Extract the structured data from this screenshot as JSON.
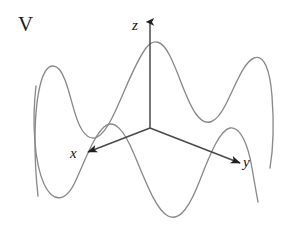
{
  "figure": {
    "panel_label": "V",
    "background_color": "#ffffff",
    "curve_color": "#8a8a8a",
    "axis_color": "#4a4a4a",
    "label_color": "#141414",
    "axes": [
      {
        "id": "z",
        "label": "z",
        "direction": "up",
        "origin": [
          150,
          128
        ],
        "tip": [
          150,
          22
        ]
      },
      {
        "id": "x",
        "label": "x",
        "direction": "down-left",
        "origin": [
          150,
          128
        ],
        "tip": [
          88,
          152
        ]
      },
      {
        "id": "y",
        "label": "y",
        "direction": "down-right",
        "origin": [
          150,
          128
        ],
        "tip": [
          240,
          163
        ]
      }
    ],
    "curves": [
      {
        "name": "back-contour",
        "description": "rear wavy profile of the surface: sharp left peak, deep dip, tall central crest near z-axis, right dip, tall right crest",
        "path": "M 38,196 C 34,160 33,110 41,82 C 47,61 58,61 65,80 C 72,98 74,118 82,130 C 92,145 102,138 112,118 C 124,94 134,64 146,48 C 154,38 162,40 170,56 C 180,76 186,100 196,114 C 206,128 216,124 226,104 C 236,84 244,62 254,58 C 264,54 270,70 272,96 C 274,122 273,150 270,168"
      },
      {
        "name": "front-contour",
        "description": "front wavy profile of the surface: left dip, mid-left crest, deep central trough, right crest",
        "path": "M 36,86 C 32,120 34,162 44,184 C 53,203 66,203 76,180 C 86,158 94,136 104,127 C 114,118 124,130 134,154 C 146,182 156,210 168,216 C 180,222 190,206 200,180 C 210,154 220,130 230,128 C 240,126 248,144 252,168 C 255,186 257,196 258,202"
      }
    ]
  }
}
